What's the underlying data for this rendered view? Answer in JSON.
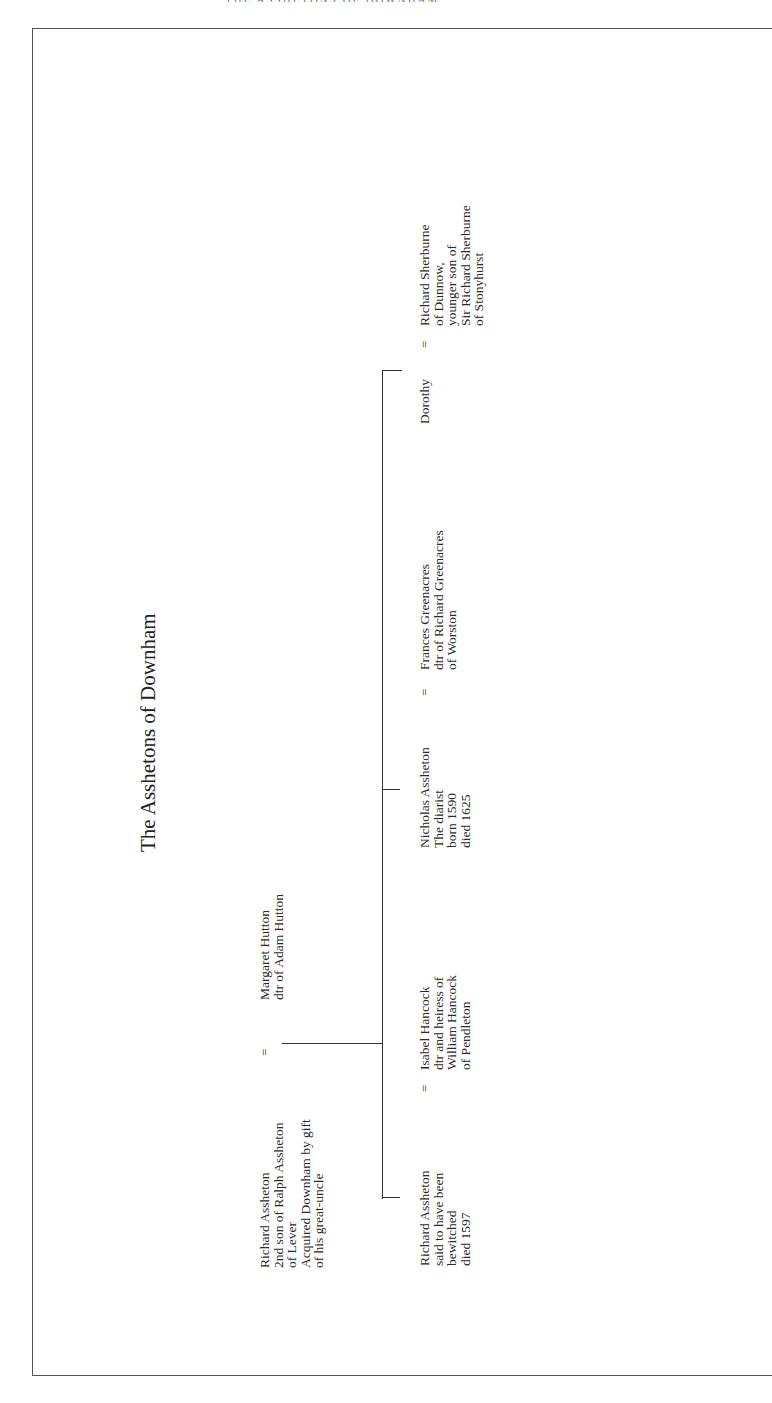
{
  "page": {
    "header_fragment": "THE ASSHETONS OF DOWNHAM"
  },
  "title": "The Asshetons of Downham",
  "generation_1": {
    "husband": {
      "lines": [
        "Richard Assheton",
        "2nd son of Ralph Assheton",
        "of Lever",
        "Acquired Downham by gift",
        "of his great-uncle"
      ]
    },
    "marriage_symbol": "=",
    "wife": {
      "lines": [
        "Margaret Hutton",
        "dtr of Adam Hutton"
      ]
    }
  },
  "generation_2": {
    "children": [
      {
        "lines": [
          "Richard Assheton",
          "said to have been",
          "bewitched",
          "died 1597"
        ],
        "marriage_symbol": "=",
        "spouse": {
          "lines": [
            "Isabel Hancock",
            "dtr and heiress of",
            "William Hancock",
            "of Pendleton"
          ]
        }
      },
      {
        "lines": [
          "Nicholas Assheton",
          "The diarist",
          "born 1590",
          "died 1625"
        ],
        "marriage_symbol": "=",
        "spouse": {
          "lines": [
            "Frances Greenacres",
            "dtr of Richard Greenacres",
            "of Worston"
          ]
        }
      },
      {
        "lines": [
          "Dorothy"
        ],
        "marriage_symbol": "=",
        "spouse": {
          "lines": [
            "Richard Sherburne",
            "of Dunnow,",
            "younger son of",
            "Sir Richard Sherburne",
            "of Stonyhurst"
          ]
        }
      }
    ]
  },
  "colors": {
    "text": "#2a2a2a",
    "lines": "#333333",
    "frame": "#555555",
    "background": "#ffffff"
  }
}
